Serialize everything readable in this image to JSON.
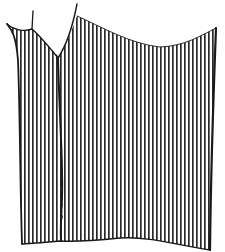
{
  "illustration": {
    "subject": "striped fabric garment panel",
    "background_color": "#ffffff",
    "stroke_color": "#1a1a1a",
    "stripe_color": "#2a2a2a",
    "stripe_spacing_px": 4,
    "stripe_width_px": 1.6
  }
}
